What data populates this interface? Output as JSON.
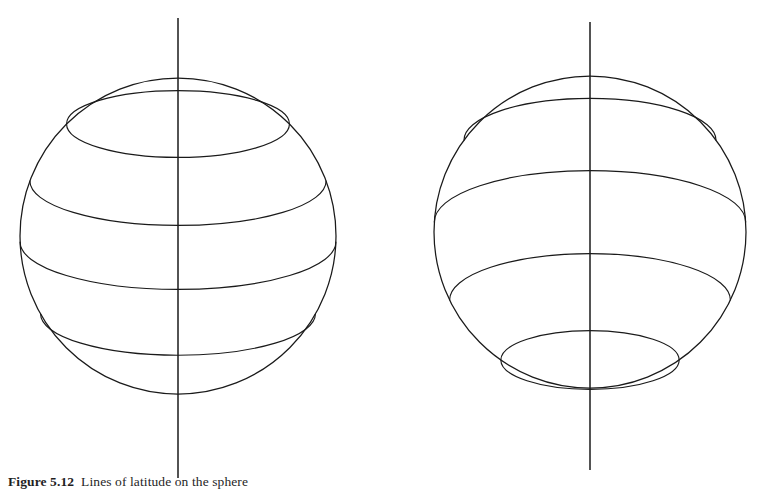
{
  "figure": {
    "kind": "line-drawing",
    "domain": "diagram",
    "background_color": "#ffffff",
    "stroke_color": "#1a1a1a",
    "width": 760,
    "height": 491,
    "caption": {
      "label": "Figure 5.12",
      "text": "Lines of latitude on the sphere",
      "clipped_at_bottom_edge": true
    },
    "spheres": [
      {
        "id": "sphere-left",
        "name": "sphere-viewed-from-above",
        "center_x": 178,
        "center_y": 236,
        "radius": 158,
        "view": "above",
        "axis": {
          "top_y": 18,
          "bottom_y": 478,
          "x": 178
        },
        "latitudes": [
          {
            "id": "lat-1",
            "offset": -112,
            "ry_ratio": 0.3,
            "full_ellipse": true
          },
          {
            "id": "lat-2",
            "offset": -55,
            "ry_ratio": 0.3,
            "full_ellipse": false
          },
          {
            "id": "lat-3",
            "offset": 6,
            "ry_ratio": 0.3,
            "full_ellipse": false
          },
          {
            "id": "lat-4",
            "offset": 78,
            "ry_ratio": 0.3,
            "full_ellipse": false
          }
        ]
      },
      {
        "id": "sphere-right",
        "name": "sphere-viewed-from-below",
        "center_x": 590,
        "center_y": 232,
        "radius": 156,
        "view": "below",
        "axis": {
          "top_y": 22,
          "bottom_y": 470,
          "x": 590
        },
        "latitudes": [
          {
            "id": "lat-1",
            "offset": -92,
            "ry_ratio": 0.33,
            "full_ellipse": false
          },
          {
            "id": "lat-2",
            "offset": -10,
            "ry_ratio": 0.33,
            "full_ellipse": false
          },
          {
            "id": "lat-3",
            "offset": 68,
            "ry_ratio": 0.33,
            "full_ellipse": false
          },
          {
            "id": "lat-4",
            "offset": 128,
            "ry_ratio": 0.33,
            "full_ellipse": true
          }
        ]
      }
    ]
  }
}
